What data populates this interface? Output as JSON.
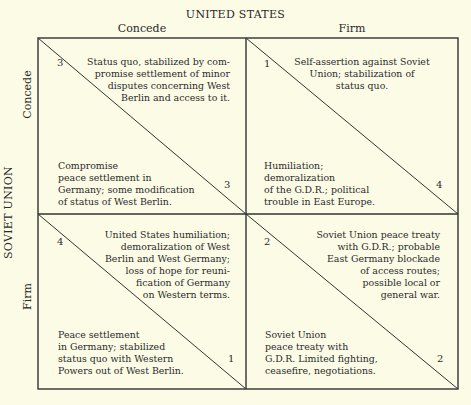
{
  "diagram": {
    "title_top": "UNITED STATES",
    "title_side": "SOVIET UNION",
    "columns": [
      {
        "label": "Concede"
      },
      {
        "label": "Firm"
      }
    ],
    "rows": [
      {
        "label": "Concede"
      },
      {
        "label": "Firm"
      }
    ],
    "cells": {
      "concede_concede": {
        "us_payoff": "3",
        "us_outcome": "Status quo, stabilized by com-\npromise settlement of minor\ndisputes concerning West\nBerlin and access to it.",
        "soviet_payoff": "3",
        "soviet_outcome": "Compromise\npeace settlement in\nGermany; some modification\nof status of West Berlin."
      },
      "concede_firm": {
        "us_payoff": "1",
        "us_outcome": "Self-assertion against Soviet\nUnion; stabilization of\nstatus quo.",
        "soviet_payoff": "4",
        "soviet_outcome": "Humiliation;\ndemoralization\nof the G.D.R.; political\ntrouble in East Europe."
      },
      "firm_concede": {
        "us_payoff": "4",
        "us_outcome": "United States humiliation;\ndemoralization of West\nBerlin and West Germany;\nloss of hope for reuni-\nfication of Germany\non Western terms.",
        "soviet_payoff": "1",
        "soviet_outcome": "Peace settlement\nin Germany; stabilized\nstatus quo with Western\nPowers out of West Berlin."
      },
      "firm_firm": {
        "us_payoff": "2",
        "us_outcome": "Soviet Union peace treaty\nwith G.D.R.; probable\nEast Germany blockade\nof access routes;\npossible local or\ngeneral war.",
        "soviet_payoff": "2",
        "soviet_outcome": "Soviet Union\npeace treaty with\nG.D.R. Limited fighting,\nceasefire, negotiations."
      }
    }
  },
  "colors": {
    "background": "#fbfbe6",
    "line": "#333333",
    "text": "#2b2b2b"
  }
}
